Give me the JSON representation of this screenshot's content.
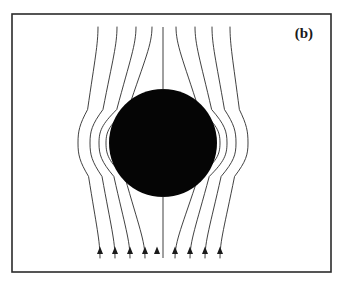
{
  "figure": {
    "panel_label": "(b)",
    "caption_text": "",
    "background_color": "#ffffff",
    "frame": {
      "name": "figure-border",
      "x": 12,
      "y": 14,
      "width": 319,
      "height": 258,
      "stroke_color": "#2b2b2b",
      "stroke_width": 1.6
    },
    "sphere": {
      "name": "conducting-sphere",
      "cx": 163,
      "cy": 143,
      "r": 54,
      "fill_color": "#050505"
    },
    "field": {
      "line_color": "#2b2b2b",
      "line_width": 0.9,
      "direction": "upward",
      "arrow_count": 9,
      "line_count": 9,
      "top_y": 27,
      "bottom_y": 258,
      "arrow_y": 254,
      "arrow_color": "#1a1a1a",
      "center_line_x": 163,
      "lines": [
        {
          "id": 1,
          "top_x": 98,
          "bottom_x": 100,
          "bulge_x": 78,
          "side": "left"
        },
        {
          "id": 2,
          "top_x": 117,
          "bottom_x": 115,
          "bulge_x": 90,
          "side": "left"
        },
        {
          "id": 3,
          "top_x": 136,
          "bottom_x": 130,
          "bulge_x": 99,
          "side": "left"
        },
        {
          "id": 4,
          "top_x": 152,
          "bottom_x": 145,
          "bulge_x": 106,
          "side": "left"
        },
        {
          "id": 5,
          "top_x": 163,
          "bottom_x": 163,
          "bulge_x": 163,
          "side": "center"
        },
        {
          "id": 6,
          "top_x": 176,
          "bottom_x": 175,
          "bulge_x": 220,
          "side": "right"
        },
        {
          "id": 7,
          "top_x": 195,
          "bottom_x": 190,
          "bulge_x": 227,
          "side": "right"
        },
        {
          "id": 8,
          "top_x": 212,
          "bottom_x": 205,
          "bulge_x": 236,
          "side": "right"
        },
        {
          "id": 9,
          "top_x": 230,
          "bottom_x": 220,
          "bulge_x": 248,
          "side": "right"
        }
      ],
      "arrow_x_positions": [
        100,
        115,
        130,
        145,
        157,
        175,
        190,
        205,
        220
      ]
    },
    "label_position": {
      "x": 313,
      "y": 38
    }
  },
  "chart_data": {
    "type": "diagram",
    "title": "(b)",
    "xlabel": "",
    "ylabel": "",
    "grid": false,
    "legend": "none"
  }
}
